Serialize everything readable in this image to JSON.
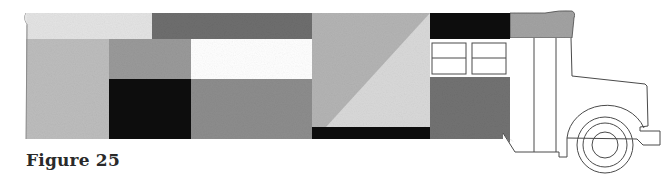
{
  "figure": {
    "caption": "Figure 25"
  },
  "colors": {
    "light_cream": "#e4e4e4",
    "dark_gray": "#6e6e6e",
    "light_gray": "#bdbdbd",
    "mid_gray": "#9a9a9a",
    "white": "#ffffff",
    "black": "#0d0d0d",
    "mid_gray_2": "#8d8d8d",
    "diag_dark": "#b4b4b4",
    "diag_light": "#d9d9d9",
    "rear_dark": "#727272",
    "roof_gray": "#a3a3a3",
    "outline": "#4a4a4a"
  },
  "blocks": [
    {
      "name": "top-left-light-block",
      "x": 26,
      "y": 13,
      "w": 126,
      "h": 26,
      "color": "light_cream"
    },
    {
      "name": "top-dark-gray-block",
      "x": 152,
      "y": 13,
      "w": 160,
      "h": 26,
      "color": "dark_gray"
    },
    {
      "name": "left-light-gray-column",
      "x": 26,
      "y": 39,
      "w": 83,
      "h": 100,
      "color": "light_gray"
    },
    {
      "name": "upper-mid-gray-block",
      "x": 109,
      "y": 39,
      "w": 82,
      "h": 40,
      "color": "mid_gray"
    },
    {
      "name": "white-window-block",
      "x": 191,
      "y": 39,
      "w": 121,
      "h": 40,
      "color": "white"
    },
    {
      "name": "lower-black-block",
      "x": 109,
      "y": 79,
      "w": 82,
      "h": 60,
      "color": "black"
    },
    {
      "name": "lower-mid-gray-block",
      "x": 191,
      "y": 79,
      "w": 121,
      "h": 60,
      "color": "mid_gray_2"
    },
    {
      "name": "bottom-black-strip",
      "x": 312,
      "y": 127,
      "w": 118,
      "h": 12,
      "color": "black"
    },
    {
      "name": "black-top-block",
      "x": 430,
      "y": 13,
      "w": 80,
      "h": 26,
      "color": "black"
    }
  ],
  "diagonal_block": {
    "x": 312,
    "y": 13,
    "w": 118,
    "h": 114,
    "upper_color": "diag_dark",
    "lower_color": "diag_light"
  },
  "windows": [
    {
      "x": 432,
      "y": 43,
      "w": 34,
      "h": 31,
      "divider_y": 58
    },
    {
      "x": 472,
      "y": 43,
      "w": 34,
      "h": 31,
      "divider_y": 58
    }
  ],
  "wheel": {
    "cx": 605,
    "cy": 145,
    "r_outer": 28,
    "r_middle": 22,
    "r_hub": 13
  }
}
